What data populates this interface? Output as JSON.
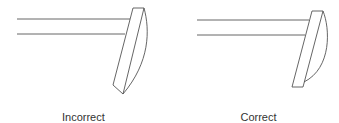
{
  "diagram": {
    "panels": [
      {
        "id": "incorrect",
        "label": "Incorrect",
        "description": "Two parallel horizontal lines meeting a tilted lens whose curved edge converges to a pointed bottom"
      },
      {
        "id": "correct",
        "label": "Correct",
        "description": "Two parallel horizontal lines meeting a tilted lens with a flat bottom edge and curved back"
      }
    ],
    "colors": {
      "stroke": "#555555",
      "text": "#333333",
      "background": "#ffffff"
    }
  }
}
